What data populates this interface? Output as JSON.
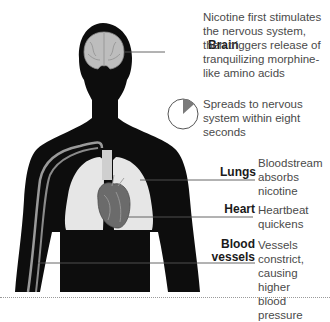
{
  "diagram": {
    "topic": "Effects of nicotine on the body",
    "callouts": [
      {
        "id": "brain",
        "label": "Brain",
        "text": [
          "Nicotine first stimulates",
          "the nervous system,",
          "then triggers release of",
          "tranquilizing morphine-",
          "like amino acids"
        ]
      },
      {
        "id": "spread",
        "label": "",
        "text": [
          "Spreads to nervous",
          "system within eight",
          "seconds"
        ]
      },
      {
        "id": "lungs",
        "label": "Lungs",
        "text": [
          "Bloodstream",
          "absorbs",
          "nicotine"
        ]
      },
      {
        "id": "heart",
        "label": "Heart",
        "text": [
          "Heartbeat",
          "quickens"
        ]
      },
      {
        "id": "vessels",
        "label": [
          "Blood",
          "vessels"
        ],
        "text": [
          "Vessels",
          "constrict,",
          "causing higher",
          "blood pressure"
        ]
      }
    ],
    "pie": {
      "seconds": 8,
      "of": 60,
      "fill": "#7a7a7a"
    },
    "colors": {
      "silhouette": "#0d0d0d",
      "organ_light": "#e6e6e6",
      "heart": "#6b6b6b",
      "vein": "#9a9a9a",
      "leader": "#555555"
    }
  }
}
